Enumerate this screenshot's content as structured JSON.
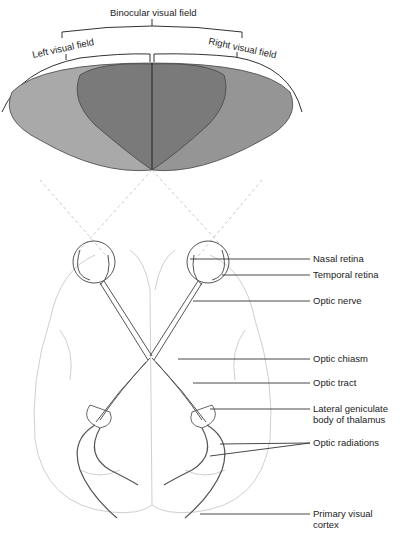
{
  "diagram": {
    "title_labels": {
      "binocular": "Binocular visual field",
      "left": "Left visual field",
      "right": "Right visual field"
    },
    "colors": {
      "left_field": "#a9a9a9",
      "binocular_field": "#7a7a7a",
      "right_field": "#959595",
      "outline": "#444444",
      "pathway": "#555555",
      "brain_outline": "#cfcfcf",
      "leader_line": "#333333",
      "dashed_rays": "#c8c8c8"
    },
    "labels": [
      {
        "id": "nasal-retina",
        "text": "Nasal retina"
      },
      {
        "id": "temporal-retina",
        "text": "Temporal retina"
      },
      {
        "id": "optic-nerve",
        "text": "Optic nerve"
      },
      {
        "id": "optic-chiasm",
        "text": "Optic chiasm"
      },
      {
        "id": "optic-tract",
        "text": "Optic tract"
      },
      {
        "id": "lateral-geniculate",
        "text": "Lateral geniculate body of thalamus"
      },
      {
        "id": "optic-radiations",
        "text": "Optic radiations"
      },
      {
        "id": "primary-visual-cortex",
        "text": "Primary visual cortex"
      }
    ]
  }
}
